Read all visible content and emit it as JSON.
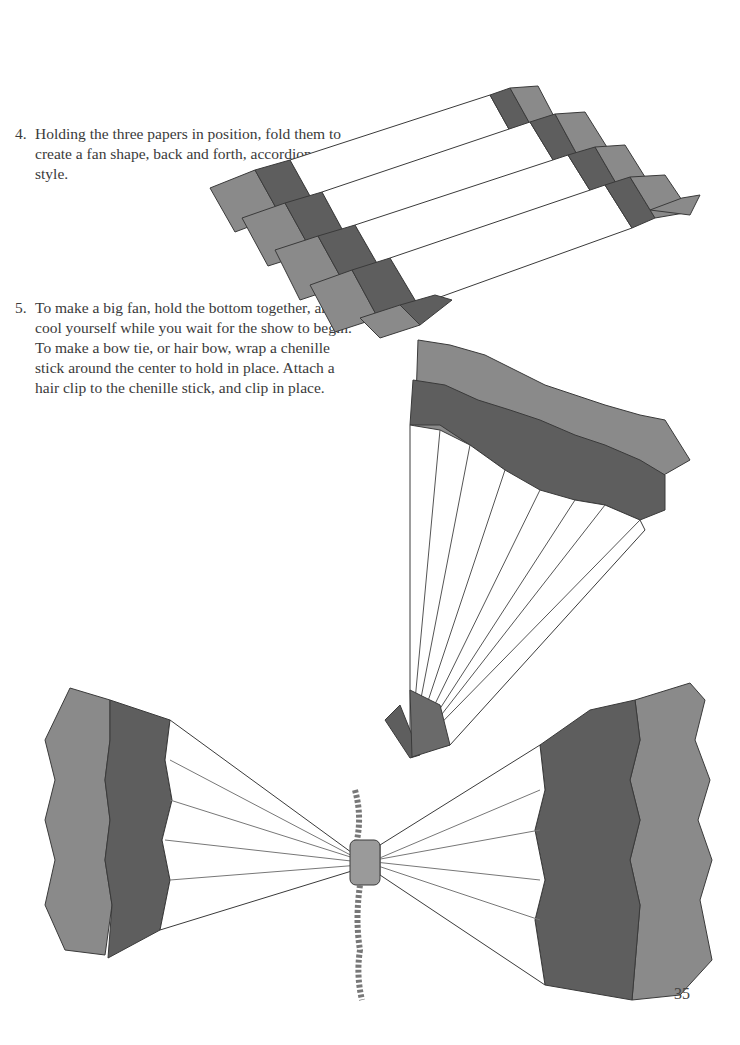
{
  "steps": [
    {
      "number": "4.",
      "text": "Holding the three papers in position, fold them to create a fan shape, back and forth, accordion style."
    },
    {
      "number": "5.",
      "text": "To make a big fan, hold the bottom together, and cool yourself while you wait for the show to begin. To make a bow tie, or hair bow, wrap a chenille stick around the center to hold in place. Attach a hair clip to the chenille stick, and clip in place."
    }
  ],
  "illustrations": [
    {
      "name": "accordion-folded-papers"
    },
    {
      "name": "paper-fan"
    },
    {
      "name": "bow-tie"
    }
  ],
  "page_number": "35",
  "colors": {
    "dark": "#5e5e5e",
    "mid": "#8a8a8a",
    "light": "#ffffff",
    "line": "#3a3a3a"
  }
}
